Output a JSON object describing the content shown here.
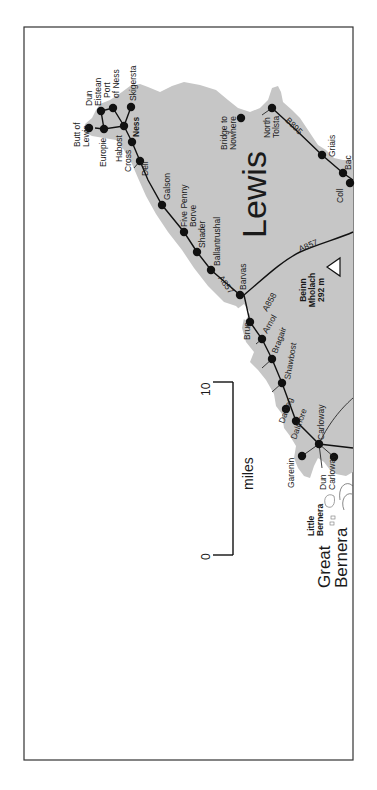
{
  "map": {
    "title": "Lewis",
    "orientation": "rotated-90-ccw",
    "colors": {
      "land": "#c6c6c6",
      "sea": "#ffffff",
      "road": "#111111",
      "frame": "#333333",
      "dot": "#111111"
    },
    "region_label": "Lewis",
    "island_label_line1": "Great",
    "island_label_line2": "Bernera",
    "little_bernera_line1": "Little",
    "little_bernera_line2": "Bernera",
    "peak": {
      "name_line1": "Beinn",
      "name_line2": "Mholach",
      "elevation": "292 m"
    },
    "roads": {
      "a857_north": "A857",
      "a857_east": "A857",
      "a858": "A858",
      "b895": "B895"
    },
    "scale_bar": {
      "start": "0",
      "end": "10",
      "unit": "miles"
    },
    "places": [
      {
        "id": "butt-of-lewis",
        "line1": "Butt of",
        "line2": "Lewis",
        "x": 89,
        "y": 128
      },
      {
        "id": "dun-eistean",
        "line1": "Dun",
        "line2": "Eistean",
        "x": 101,
        "y": 111
      },
      {
        "id": "port-of-ness",
        "line1": "Port",
        "line2": "of Ness",
        "x": 113,
        "y": 108
      },
      {
        "id": "skigersta",
        "line1": "Skigersta",
        "line2": "",
        "x": 131,
        "y": 107
      },
      {
        "id": "europie",
        "line1": "Europie",
        "line2": "",
        "x": 104,
        "y": 129
      },
      {
        "id": "habost",
        "line1": "Habost",
        "line2": "",
        "x": 124,
        "y": 126
      },
      {
        "id": "ness",
        "line1": "Ness",
        "line2": "",
        "x": 124,
        "y": 126
      },
      {
        "id": "cross",
        "line1": "Cross",
        "line2": "",
        "x": 132,
        "y": 142
      },
      {
        "id": "dell",
        "line1": "Dell",
        "line2": "",
        "x": 140,
        "y": 161
      },
      {
        "id": "galson",
        "line1": "Galson",
        "line2": "",
        "x": 162,
        "y": 205
      },
      {
        "id": "five-penny-borve",
        "line1": "Five Penny",
        "line2": "Borve",
        "x": 184,
        "y": 232
      },
      {
        "id": "shader",
        "line1": "Shader",
        "line2": "",
        "x": 197,
        "y": 252
      },
      {
        "id": "ballantrushal",
        "line1": "Ballantrushal",
        "line2": "",
        "x": 211,
        "y": 270
      },
      {
        "id": "barvas",
        "line1": "Barvas",
        "line2": "",
        "x": 240,
        "y": 295
      },
      {
        "id": "brue",
        "line1": "Brue",
        "line2": "",
        "x": 250,
        "y": 322
      },
      {
        "id": "arnol",
        "line1": "Arnol",
        "line2": "",
        "x": 262,
        "y": 339
      },
      {
        "id": "bragair",
        "line1": "Bragair",
        "line2": "",
        "x": 272,
        "y": 359
      },
      {
        "id": "shawbost",
        "line1": "Shawbost",
        "line2": "",
        "x": 282,
        "y": 383
      },
      {
        "id": "dalbeg",
        "line1": "Dalbeg",
        "line2": "",
        "x": 286,
        "y": 409
      },
      {
        "id": "dalmore",
        "line1": "Dalmore",
        "line2": "",
        "x": 296,
        "y": 421
      },
      {
        "id": "carloway",
        "line1": "Carloway",
        "line2": "",
        "x": 319,
        "y": 444
      },
      {
        "id": "garenin",
        "line1": "Garenin",
        "line2": "",
        "x": 302,
        "y": 456
      },
      {
        "id": "dun-carloway",
        "line1": "Dun",
        "line2": "Carloway",
        "x": 334,
        "y": 457
      },
      {
        "id": "bridge-to-nowhere",
        "line1": "Bridge to",
        "line2": "Nowhere",
        "x": 241,
        "y": 118
      },
      {
        "id": "north-tolsta",
        "line1": "North",
        "line2": "Tolsta",
        "x": 272,
        "y": 108
      },
      {
        "id": "griais",
        "line1": "Griais",
        "line2": "",
        "x": 322,
        "y": 155
      },
      {
        "id": "bac",
        "line1": "Bac",
        "line2": "",
        "x": 343,
        "y": 173
      },
      {
        "id": "coll",
        "line1": "Coll",
        "line2": "",
        "x": 350,
        "y": 183
      }
    ]
  }
}
